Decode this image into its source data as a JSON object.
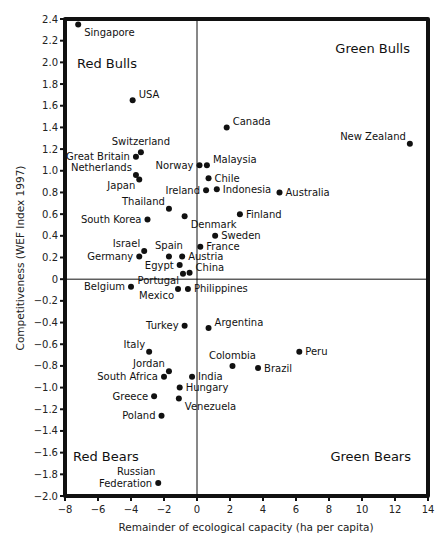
{
  "chart_data": {
    "type": "scatter",
    "title": "",
    "xlabel": "Remainder of ecological capacity (ha per capita)",
    "ylabel": "Competitiveness (WEF Index 1997)",
    "xlim": [
      -8,
      14
    ],
    "ylim": [
      -2.0,
      2.4
    ],
    "xticks": [
      -8,
      -6,
      -4,
      -2,
      0,
      2,
      4,
      6,
      8,
      10,
      12,
      14
    ],
    "yticks": [
      2.4,
      2.2,
      2.0,
      1.8,
      1.6,
      1.4,
      1.2,
      1.0,
      0.8,
      0.6,
      0.4,
      0.2,
      0,
      -0.2,
      -0.4,
      -0.6,
      -0.8,
      -1.0,
      -1.2,
      -1.4,
      -1.6,
      -1.8,
      -2.0
    ],
    "grid": false,
    "legend": null,
    "quadrant_labels": [
      {
        "text": "Red Bulls",
        "position": "top-left"
      },
      {
        "text": "Green Bulls",
        "position": "top-right"
      },
      {
        "text": "Red Bears",
        "position": "bottom-left"
      },
      {
        "text": "Green Bears",
        "position": "bottom-right"
      }
    ],
    "points": [
      {
        "label": "Singapore",
        "x": -7.2,
        "y": 2.35,
        "anchor": "right-below"
      },
      {
        "label": "USA",
        "x": -3.9,
        "y": 1.65,
        "anchor": "right-above"
      },
      {
        "label": "Canada",
        "x": 1.8,
        "y": 1.4,
        "anchor": "right-above"
      },
      {
        "label": "New Zealand",
        "x": 12.9,
        "y": 1.25,
        "anchor": "left-above"
      },
      {
        "label": "Switzerland",
        "x": -3.4,
        "y": 1.17,
        "anchor": "above"
      },
      {
        "label": "Great Britain",
        "x": -3.7,
        "y": 1.13,
        "anchor": "left"
      },
      {
        "label": "Norway",
        "x": 0.15,
        "y": 1.05,
        "anchor": "left"
      },
      {
        "label": "Malaysia",
        "x": 0.6,
        "y": 1.05,
        "anchor": "right-above"
      },
      {
        "label": "Netherlands",
        "x": -3.7,
        "y": 0.96,
        "anchor": "left-above"
      },
      {
        "label": "Japan",
        "x": -3.5,
        "y": 0.92,
        "anchor": "left-below"
      },
      {
        "label": "Chile",
        "x": 0.7,
        "y": 0.93,
        "anchor": "right"
      },
      {
        "label": "Ireland",
        "x": 0.55,
        "y": 0.82,
        "anchor": "left"
      },
      {
        "label": "Indonesia",
        "x": 1.2,
        "y": 0.83,
        "anchor": "right"
      },
      {
        "label": "Australia",
        "x": 5.0,
        "y": 0.8,
        "anchor": "right"
      },
      {
        "label": "Thailand",
        "x": -1.7,
        "y": 0.65,
        "anchor": "left-above"
      },
      {
        "label": "Finland",
        "x": 2.6,
        "y": 0.6,
        "anchor": "right"
      },
      {
        "label": "South Korea",
        "x": -3.0,
        "y": 0.55,
        "anchor": "left"
      },
      {
        "label": "Denmark",
        "x": -0.75,
        "y": 0.58,
        "anchor": "right-below"
      },
      {
        "label": "Sweden",
        "x": 1.1,
        "y": 0.4,
        "anchor": "right"
      },
      {
        "label": "France",
        "x": 0.2,
        "y": 0.3,
        "anchor": "right"
      },
      {
        "label": "Israel",
        "x": -3.2,
        "y": 0.26,
        "anchor": "left-above"
      },
      {
        "label": "Germany",
        "x": -3.5,
        "y": 0.21,
        "anchor": "left"
      },
      {
        "label": "Spain",
        "x": -1.7,
        "y": 0.21,
        "anchor": "above"
      },
      {
        "label": "Austria",
        "x": -0.9,
        "y": 0.21,
        "anchor": "right"
      },
      {
        "label": "Egypt",
        "x": -1.05,
        "y": 0.13,
        "anchor": "left"
      },
      {
        "label": "Portugal",
        "x": -0.85,
        "y": 0.05,
        "anchor": "left-below"
      },
      {
        "label": "China",
        "x": -0.45,
        "y": 0.06,
        "anchor": "right-above"
      },
      {
        "label": "Belgium",
        "x": -4.0,
        "y": -0.07,
        "anchor": "left"
      },
      {
        "label": "Mexico",
        "x": -1.15,
        "y": -0.09,
        "anchor": "left-below"
      },
      {
        "label": "Philippines",
        "x": -0.55,
        "y": -0.09,
        "anchor": "right"
      },
      {
        "label": "Turkey",
        "x": -0.75,
        "y": -0.43,
        "anchor": "left"
      },
      {
        "label": "Argentina",
        "x": 0.7,
        "y": -0.45,
        "anchor": "right-above"
      },
      {
        "label": "Italy",
        "x": -2.9,
        "y": -0.67,
        "anchor": "left-above"
      },
      {
        "label": "Peru",
        "x": 6.2,
        "y": -0.67,
        "anchor": "right"
      },
      {
        "label": "Colombia",
        "x": 2.15,
        "y": -0.8,
        "anchor": "above"
      },
      {
        "label": "Brazil",
        "x": 3.7,
        "y": -0.82,
        "anchor": "right"
      },
      {
        "label": "Jordan",
        "x": -1.7,
        "y": -0.85,
        "anchor": "left-above"
      },
      {
        "label": "South Africa",
        "x": -2.0,
        "y": -0.9,
        "anchor": "left"
      },
      {
        "label": "India",
        "x": -0.3,
        "y": -0.9,
        "anchor": "right"
      },
      {
        "label": "Hungary",
        "x": -1.05,
        "y": -1.0,
        "anchor": "right"
      },
      {
        "label": "Greece",
        "x": -2.6,
        "y": -1.08,
        "anchor": "left"
      },
      {
        "label": "Venezuela",
        "x": -1.1,
        "y": -1.1,
        "anchor": "right-below"
      },
      {
        "label": "Poland",
        "x": -2.15,
        "y": -1.26,
        "anchor": "left"
      },
      {
        "label": "Russian Federation",
        "x": -2.35,
        "y": -1.88,
        "anchor": "left-two-line"
      }
    ]
  },
  "axes": {
    "x_title": "Remainder of ecological capacity (ha per capita)",
    "y_title": "Competitiveness (WEF Index 1997)"
  },
  "quadrants": {
    "top_left": "Red Bulls",
    "top_right": "Green Bulls",
    "bottom_left": "Red Bears",
    "bottom_right": "Green Bears"
  },
  "colors": {
    "frame": "#111111",
    "point": "#111111",
    "text": "#111111",
    "background": "#ffffff"
  }
}
